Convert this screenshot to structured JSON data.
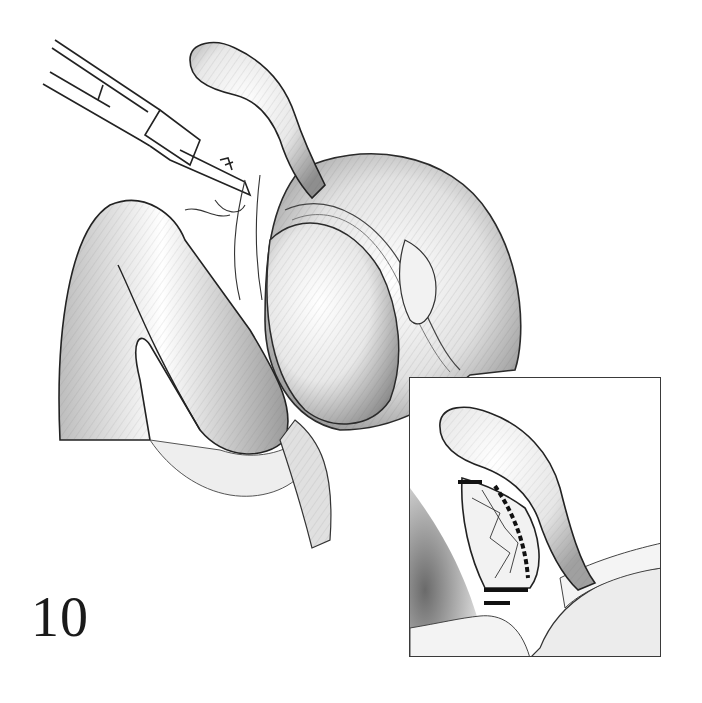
{
  "figure": {
    "number": "10",
    "main_view": {
      "elements": [
        "forceps-instrument",
        "appendix",
        "bowel-loops",
        "cecum",
        "mesentery"
      ]
    },
    "inset": {
      "elements": [
        "appendix-detail",
        "ligated-mesoappendix",
        "ligature-ties"
      ]
    }
  },
  "colors": {
    "ink": "#2a2a2a",
    "shade": "#9a9a9a",
    "light": "#e6e6e6",
    "background": "#ffffff"
  }
}
